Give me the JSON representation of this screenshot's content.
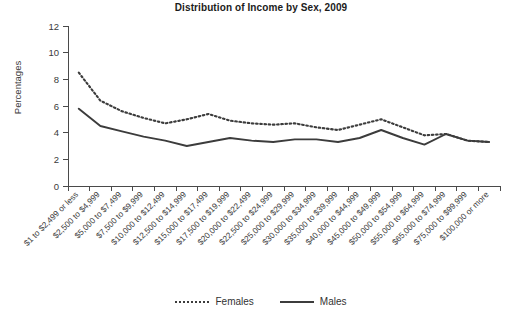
{
  "chart_data": {
    "type": "line",
    "title": "Distribution of Income by Sex, 2009",
    "xlabel": "",
    "ylabel": "Percentages",
    "ylim": [
      0,
      12
    ],
    "ytick_values": [
      0,
      2,
      4,
      6,
      8,
      10,
      12
    ],
    "ytick_labels": [
      "0",
      "2",
      "4",
      "6",
      "8",
      "10",
      "12"
    ],
    "grid": false,
    "legend_position": "bottom-center",
    "categories": [
      "$1 to $2,499 or less",
      "$2,500 to $4,999",
      "$5,000 to $7,499",
      "$7,500 to $9,999",
      "$10,000 to $12,499",
      "$12,500 to $14,999",
      "$15,000 to $17,499",
      "$17,500 to $19,999",
      "$20,000 to $22,499",
      "$22,500 to $24,999",
      "$25,000 to $29,999",
      "$30,000 to $34,999",
      "$35,000 to $39,999",
      "$40,000 to $44,999",
      "$45,000 to $49,999",
      "$50,000 to $54,999",
      "$55,000 to $64,999",
      "$65,000 to $74,999",
      "$75,000 to $99,999",
      "$100,000 or more"
    ],
    "series": [
      {
        "name": "Females",
        "style": "dotted",
        "color": "#3c3c3c",
        "values": [
          8.5,
          6.4,
          5.6,
          5.1,
          4.7,
          5.0,
          5.4,
          4.9,
          4.7,
          4.6,
          4.7,
          4.4,
          4.2,
          4.6,
          5.0,
          4.4,
          3.8,
          3.9,
          3.4,
          3.3
        ]
      },
      {
        "name": "Males",
        "style": "solid",
        "color": "#3c3c3c",
        "values": [
          5.8,
          4.5,
          4.1,
          3.7,
          3.4,
          3.0,
          3.3,
          3.6,
          3.4,
          3.3,
          3.5,
          3.5,
          3.3,
          3.6,
          4.2,
          3.6,
          3.1,
          3.9,
          3.4,
          3.3
        ]
      }
    ],
    "males_values_right": [
      7.0,
      7.05,
      6.65,
      6.1,
      5.95,
      5.3,
      4.8,
      5.1,
      7.0,
      5.2,
      9.7
    ],
    "females_values_right": [
      8.0,
      7.6,
      7.1,
      6.1,
      5.7,
      4.9,
      4.4,
      4.3,
      4.9,
      4.0,
      4.5,
      4.25,
      3.4
    ]
  },
  "legend": {
    "items": [
      {
        "label": "Females",
        "style": "dotted"
      },
      {
        "label": "Males",
        "style": "solid"
      }
    ]
  }
}
